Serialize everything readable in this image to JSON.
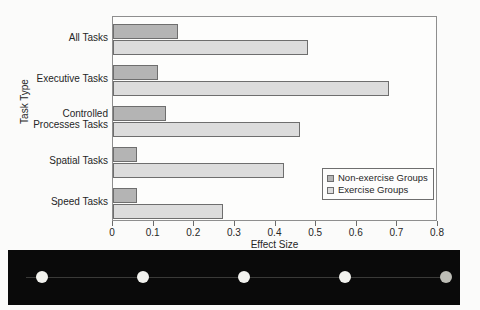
{
  "figure": {
    "title_remnant": "",
    "background_color": "#fbfbfa"
  },
  "chart_data": {
    "type": "bar",
    "orientation": "horizontal",
    "title": "",
    "xlabel": "Effect Size",
    "ylabel": "Task Type",
    "xlim": [
      0,
      0.8
    ],
    "xticks": [
      "0",
      "0.1",
      "0.2",
      "0.3",
      "0.4",
      "0.5",
      "0.6",
      "0.7",
      "0.8"
    ],
    "xtick_values": [
      0,
      0.1,
      0.2,
      0.3,
      0.4,
      0.5,
      0.6,
      0.7,
      0.8
    ],
    "grid": false,
    "legend_position": "lower right",
    "categories": [
      "All Tasks",
      "Executive Tasks",
      "Controlled Processes Tasks",
      "Spatial Tasks",
      "Speed Tasks"
    ],
    "category_labels": [
      [
        "All Tasks"
      ],
      [
        "Executive Tasks"
      ],
      [
        "Controlled",
        "Processes Tasks"
      ],
      [
        "Spatial Tasks"
      ],
      [
        "Speed Tasks"
      ]
    ],
    "series": [
      {
        "name": "Non-exercise Groups",
        "color": "#b4b4b4",
        "values": [
          0.16,
          0.11,
          0.13,
          0.06,
          0.06
        ]
      },
      {
        "name": "Exercise Groups",
        "color": "#dcdcdc",
        "values": [
          0.48,
          0.68,
          0.46,
          0.42,
          0.27
        ]
      }
    ]
  },
  "legend": {
    "entries": [
      {
        "label": "Non-exercise Groups",
        "color": "#b4b4b4"
      },
      {
        "label": "Exercise Groups",
        "color": "#dcdcdc"
      }
    ]
  },
  "scan_artifact": {
    "dot_count": 5,
    "background_color": "#0a0a0a"
  }
}
